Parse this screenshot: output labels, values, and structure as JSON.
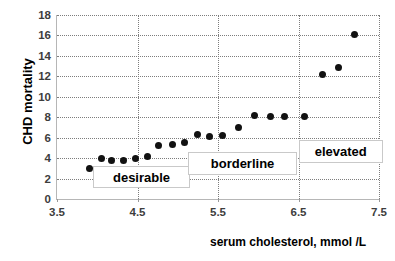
{
  "chart_data": {
    "type": "scatter",
    "title": "",
    "xlabel": "serum cholesterol, mmol /L",
    "ylabel": "CHD mortality",
    "xlim": [
      3.5,
      7.5
    ],
    "ylim": [
      0,
      18
    ],
    "xticks": [
      "3.5",
      "4.5",
      "5.5",
      "6.5",
      "7.5"
    ],
    "xtick_values": [
      3.5,
      4.5,
      5.5,
      6.5,
      7.5
    ],
    "yticks": [
      "0",
      "2",
      "4",
      "6",
      "8",
      "10",
      "12",
      "14",
      "16",
      "18"
    ],
    "ytick_values": [
      0,
      2,
      4,
      6,
      8,
      10,
      12,
      14,
      16,
      18
    ],
    "grid": true,
    "legend": "none",
    "marker_color": "#111111",
    "grid_color": "#7d7d7d",
    "points": [
      {
        "x": 3.9,
        "y": 3.0
      },
      {
        "x": 4.05,
        "y": 4.0
      },
      {
        "x": 4.18,
        "y": 3.75
      },
      {
        "x": 4.32,
        "y": 3.8
      },
      {
        "x": 4.47,
        "y": 4.0
      },
      {
        "x": 4.62,
        "y": 4.15
      },
      {
        "x": 4.76,
        "y": 5.2
      },
      {
        "x": 4.93,
        "y": 5.35
      },
      {
        "x": 5.08,
        "y": 5.5
      },
      {
        "x": 5.25,
        "y": 6.35
      },
      {
        "x": 5.4,
        "y": 6.15
      },
      {
        "x": 5.56,
        "y": 6.2
      },
      {
        "x": 5.75,
        "y": 7.0
      },
      {
        "x": 5.95,
        "y": 8.15
      },
      {
        "x": 6.15,
        "y": 8.1
      },
      {
        "x": 6.33,
        "y": 8.1
      },
      {
        "x": 6.57,
        "y": 8.05
      },
      {
        "x": 6.8,
        "y": 12.2
      },
      {
        "x": 7.0,
        "y": 12.85
      },
      {
        "x": 7.2,
        "y": 16.1
      }
    ],
    "annotations": [
      {
        "label": "desirable",
        "x_range": [
          3.95,
          5.15
        ],
        "y_range": [
          1.05,
          3.25
        ]
      },
      {
        "label": "borderline",
        "x_range": [
          5.13,
          6.48
        ],
        "y_range": [
          2.35,
          4.55
        ]
      },
      {
        "label": "elevated",
        "x_range": [
          6.5,
          7.55
        ],
        "y_range": [
          3.55,
          5.75
        ]
      }
    ]
  }
}
